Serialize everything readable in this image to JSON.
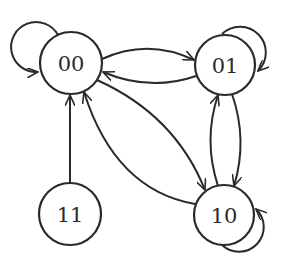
{
  "diagram": {
    "type": "state-transition-diagram",
    "colors": {
      "stroke": "#2a2a2a",
      "background": "#ffffff",
      "node_fill": "#ffffff"
    },
    "nodes": [
      {
        "id": "00",
        "label": "00",
        "cx": 71,
        "cy": 63,
        "r": 31
      },
      {
        "id": "01",
        "label": "01",
        "cx": 225,
        "cy": 65,
        "r": 30
      },
      {
        "id": "11",
        "label": "11",
        "cx": 70,
        "cy": 214,
        "r": 31
      },
      {
        "id": "10",
        "label": "10",
        "cx": 224,
        "cy": 215,
        "r": 30
      }
    ],
    "edges": [
      {
        "from": "00",
        "to": "00",
        "kind": "self-loop"
      },
      {
        "from": "01",
        "to": "01",
        "kind": "self-loop"
      },
      {
        "from": "10",
        "to": "10",
        "kind": "self-loop"
      },
      {
        "from": "00",
        "to": "01",
        "kind": "curved"
      },
      {
        "from": "01",
        "to": "00",
        "kind": "curved"
      },
      {
        "from": "01",
        "to": "10",
        "kind": "curved"
      },
      {
        "from": "10",
        "to": "01",
        "kind": "curved"
      },
      {
        "from": "00",
        "to": "10",
        "kind": "curved"
      },
      {
        "from": "10",
        "to": "00",
        "kind": "curved"
      },
      {
        "from": "11",
        "to": "00",
        "kind": "straight"
      }
    ]
  }
}
